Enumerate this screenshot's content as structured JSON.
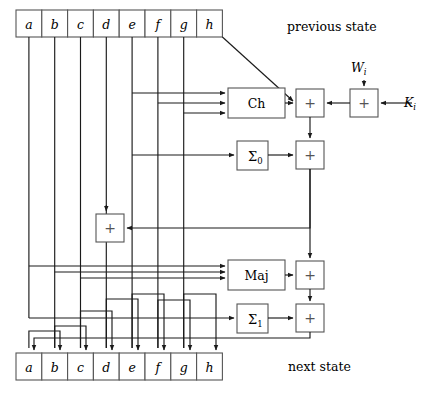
{
  "figure": {
    "previous_state_label": "previous state",
    "next_state_label": "next state"
  },
  "registers": {
    "previous": [
      {
        "name": "a"
      },
      {
        "name": "b"
      },
      {
        "name": "c"
      },
      {
        "name": "d"
      },
      {
        "name": "e"
      },
      {
        "name": "f"
      },
      {
        "name": "g"
      },
      {
        "name": "h"
      }
    ],
    "next": [
      {
        "name": "a"
      },
      {
        "name": "b"
      },
      {
        "name": "c"
      },
      {
        "name": "d"
      },
      {
        "name": "e"
      },
      {
        "name": "f"
      },
      {
        "name": "g"
      },
      {
        "name": "h"
      }
    ]
  },
  "functions": {
    "ch": "Ch",
    "maj": "Maj",
    "sigma0_main": "Σ",
    "sigma0_sub": "0",
    "sigma1_main": "Σ",
    "sigma1_sub": "1"
  },
  "inputs": {
    "w_main": "W",
    "w_sub": "i",
    "k_main": "K",
    "k_sub": "i"
  },
  "adders": {
    "glyph": "+",
    "count": 6,
    "names": [
      "adder-ch-top",
      "adder-wi-ki",
      "adder-sigma0",
      "adder-d-feed",
      "adder-maj",
      "adder-sigma1"
    ]
  },
  "colors": {
    "stroke": "#1a1a1a",
    "box_stroke": "#555555",
    "background": "#ffffff",
    "plus_glyph": "#555555"
  }
}
